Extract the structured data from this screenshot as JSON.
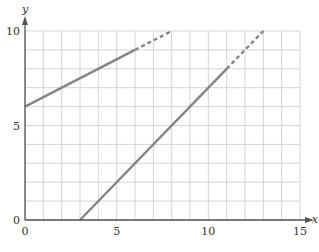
{
  "chart_data": {
    "type": "line",
    "title": "",
    "xlabel": "x",
    "ylabel": "y",
    "xlim": [
      0,
      15
    ],
    "ylim": [
      0,
      10
    ],
    "grid": true,
    "grid_step": 1,
    "x_ticks": [
      0,
      5,
      10,
      15
    ],
    "x_tick_labels": [
      "0",
      "5",
      "10",
      "15"
    ],
    "y_ticks": [
      0,
      5,
      10
    ],
    "y_tick_labels": [
      "0",
      "5",
      "10"
    ],
    "legend": null,
    "series": [
      {
        "name": "line-1",
        "equation": "y = 0.5x + 6",
        "solid": [
          [
            0,
            6
          ],
          [
            6,
            9
          ]
        ],
        "dashed": [
          [
            6,
            9
          ],
          [
            8,
            10
          ]
        ]
      },
      {
        "name": "line-2",
        "equation": "y = x - 3",
        "solid": [
          [
            3,
            0
          ],
          [
            11,
            8
          ]
        ],
        "dashed": [
          [
            11,
            8
          ],
          [
            13,
            10
          ]
        ]
      }
    ],
    "colors": {
      "line": "#858585",
      "grid": "#d4d4d4",
      "axis": "#555555"
    }
  }
}
